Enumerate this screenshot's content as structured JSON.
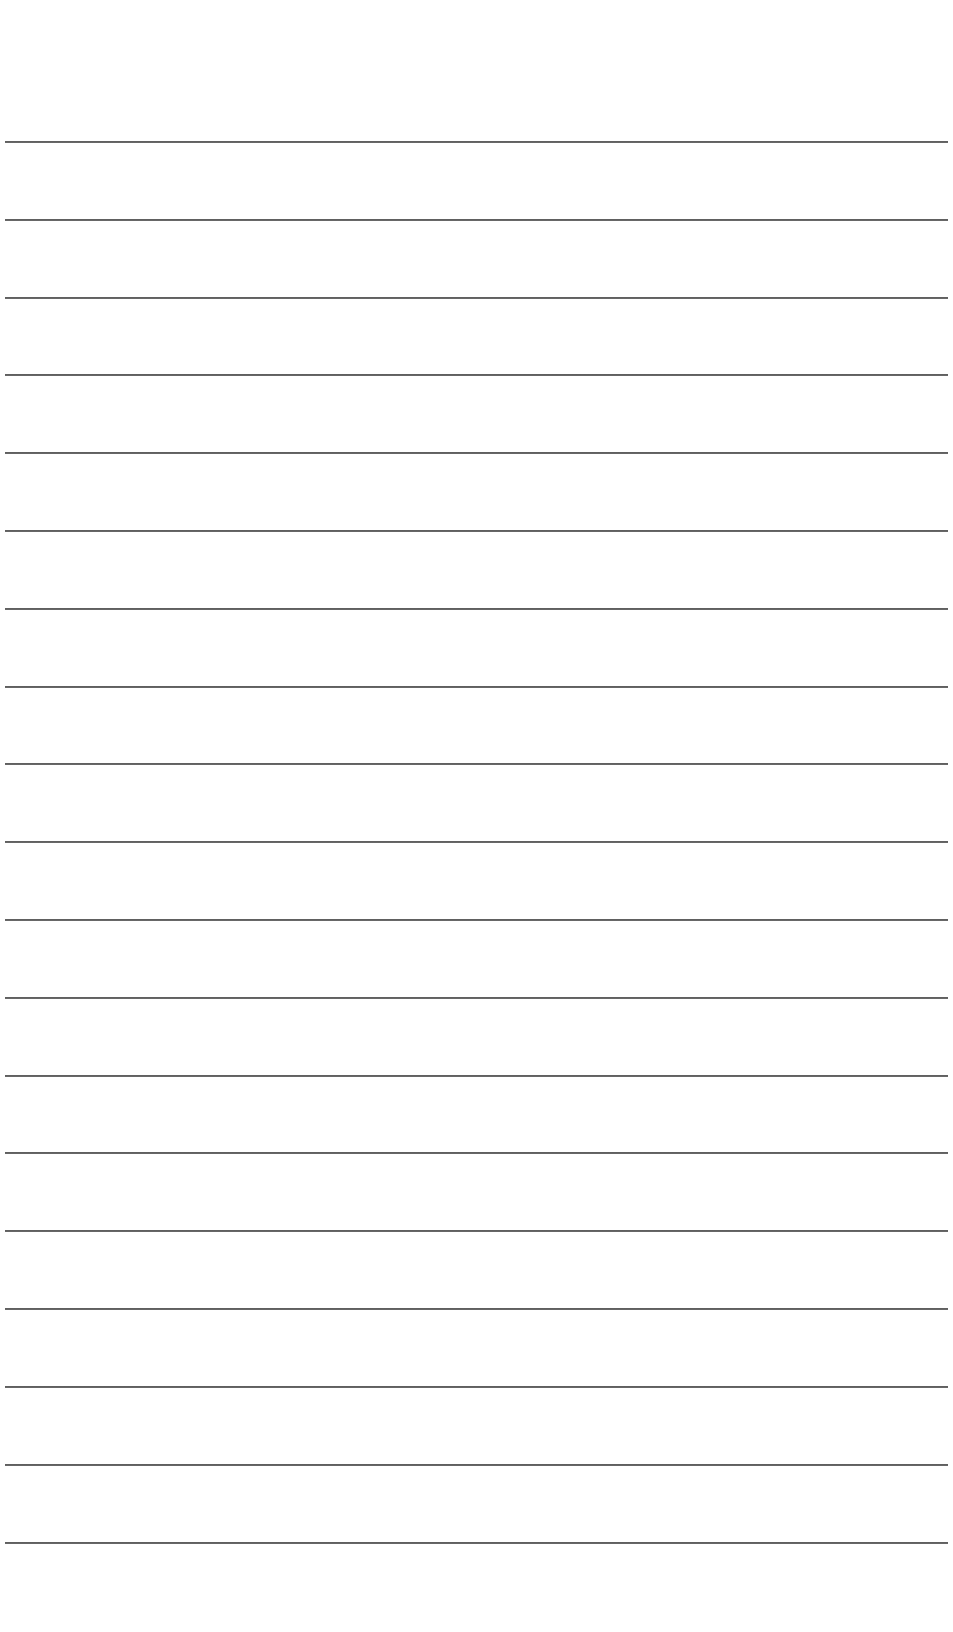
{
  "document": {
    "type": "lined-paper",
    "background_color": "#ffffff",
    "line_color": "#3f3f3f",
    "line_count": 19,
    "line_left": 5,
    "line_right": 948,
    "first_line_y": 142,
    "line_spacing": 77.8,
    "lines": [
      {
        "index": 1,
        "y": 142,
        "text": ""
      },
      {
        "index": 2,
        "y": 220,
        "text": ""
      },
      {
        "index": 3,
        "y": 298,
        "text": ""
      },
      {
        "index": 4,
        "y": 375,
        "text": ""
      },
      {
        "index": 5,
        "y": 453,
        "text": ""
      },
      {
        "index": 6,
        "y": 531,
        "text": ""
      },
      {
        "index": 7,
        "y": 609,
        "text": ""
      },
      {
        "index": 8,
        "y": 687,
        "text": ""
      },
      {
        "index": 9,
        "y": 764,
        "text": ""
      },
      {
        "index": 10,
        "y": 842,
        "text": ""
      },
      {
        "index": 11,
        "y": 920,
        "text": ""
      },
      {
        "index": 12,
        "y": 998,
        "text": ""
      },
      {
        "index": 13,
        "y": 1076,
        "text": ""
      },
      {
        "index": 14,
        "y": 1153,
        "text": ""
      },
      {
        "index": 15,
        "y": 1231,
        "text": ""
      },
      {
        "index": 16,
        "y": 1309,
        "text": ""
      },
      {
        "index": 17,
        "y": 1387,
        "text": ""
      },
      {
        "index": 18,
        "y": 1465,
        "text": ""
      },
      {
        "index": 19,
        "y": 1543,
        "text": ""
      }
    ]
  }
}
